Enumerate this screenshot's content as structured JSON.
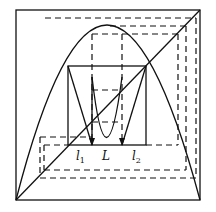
{
  "diagram": {
    "type": "cobweb-iteration-diagram",
    "labels": {
      "l1": "l",
      "l1_sub": "1",
      "L": "L",
      "l2": "l",
      "l2_sub": "2"
    },
    "colors": {
      "stroke": "#111111",
      "background": "#ffffff"
    }
  }
}
